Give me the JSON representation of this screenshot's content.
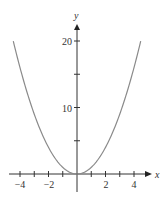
{
  "chart_data": {
    "type": "line",
    "title": "",
    "function": "y = x^2",
    "xlabel": "x",
    "ylabel": "y",
    "xlim": [
      -4.47,
      4.47
    ],
    "ylim": [
      0,
      20
    ],
    "x_ticks": [
      -4,
      -3,
      -2,
      -1,
      1,
      2,
      3,
      4
    ],
    "x_tick_labels": [
      "-4",
      "-2",
      "2",
      "4"
    ],
    "y_ticks": [
      5,
      10,
      15,
      20
    ],
    "y_tick_labels": [
      "10",
      "20"
    ],
    "grid": false,
    "series": [
      {
        "name": "y = x^2",
        "x": [
          -4.47,
          -4,
          -3,
          -2,
          -1,
          0,
          1,
          2,
          3,
          4,
          4.47
        ],
        "y": [
          20,
          16,
          9,
          4,
          1,
          0,
          1,
          4,
          9,
          16,
          20
        ]
      }
    ],
    "colors": {
      "curve": "#8a8a8a",
      "axis": "#333333"
    }
  },
  "labels": {
    "x_axis": "x",
    "y_axis": "y",
    "xt_m4": "−4",
    "xt_m2": "−2",
    "xt_2": "2",
    "xt_4": "4",
    "yt_10": "10",
    "yt_20": "20"
  }
}
